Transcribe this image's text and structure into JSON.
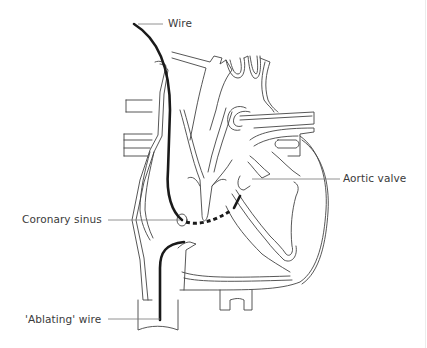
{
  "figure": {
    "type": "anatomical line drawing",
    "colors": {
      "outline": "#444444",
      "wire": "#1a1a1a",
      "leader": "#777777",
      "text": "#3a3a3a",
      "background": "#ffffff"
    }
  },
  "labels": {
    "wire": "Wire",
    "aortic_valve": "Aortic valve",
    "coronary_sinus": "Coronary sinus",
    "ablating_wire": "'Ablating' wire"
  }
}
